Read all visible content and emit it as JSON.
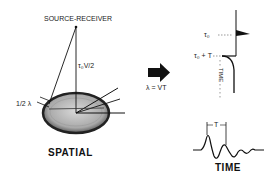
{
  "spatial": {
    "title": "SPATIAL",
    "source_label": "SOURCE-RECEIVER",
    "distance_label": "τ₀V/2",
    "half_wavelength_label": "1/2 λ"
  },
  "arrow": {
    "relation_label": "λ = VT"
  },
  "time_trace": {
    "t0_label": "τ₀",
    "t0_plus_t_label": "τ₀ + T",
    "axis_label": "TIME"
  },
  "waveform": {
    "period_label": "T",
    "title": "TIME"
  },
  "colors": {
    "ink": "#111111",
    "disc_fill": "#bdbdbd",
    "disc_rim": "#2a2a2a"
  }
}
